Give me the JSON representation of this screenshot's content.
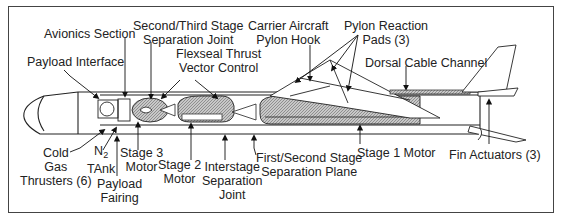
{
  "diagram": {
    "colors": {
      "line": "#222222",
      "hatch": "#9a9a9a",
      "frame": "#444444",
      "background": "#ffffff"
    },
    "labels": {
      "avionics_section": "Avionics Section",
      "second_third_stage_sep_line1": "Second/Third Stage",
      "second_third_stage_sep_line2": "Separation Joint",
      "carrier_aircraft_line1": "Carrier Aircraft",
      "carrier_aircraft_line2": "Pylon Hook",
      "pylon_reaction_line1": "Pylon Reaction",
      "pylon_reaction_line2": "Pads (3)",
      "payload_interface": "Payload Interface",
      "flexseal_line1": "Flexseal Thrust",
      "flexseal_line2": "Vector Control",
      "dorsal_cable_channel": "Dorsal Cable Channel",
      "cold_gas_line1": "Cold",
      "cold_gas_line2": "Gas",
      "cold_gas_line3": "Thrusters (6)",
      "n2_tank_line1_main": "N",
      "n2_tank_line1_sub": "2",
      "n2_tank_line2": "TAnk",
      "stage3_line1": "Stage 3",
      "stage3_line2": "Motor",
      "payload_fairing_line1": "Payload",
      "payload_fairing_line2": "Fairing",
      "stage2_line1": "Stage 2",
      "stage2_line2": "Motor",
      "interstage_line1": "Interstage",
      "interstage_line2": "Separation",
      "interstage_line3": "Joint",
      "first_second_sep_line1": "First/Second Stage",
      "first_second_sep_line2": "Separation Plane",
      "stage1_motor": "Stage 1 Motor",
      "fin_actuators": "Fin Actuators (3)"
    }
  }
}
